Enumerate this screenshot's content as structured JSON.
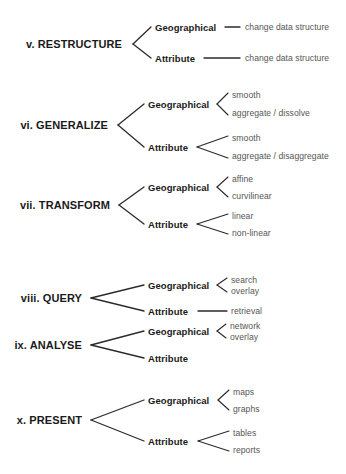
{
  "diagram": {
    "background_color": "#ffffff",
    "label_color": "#1a1a1a",
    "leaf_color": "#565656",
    "line_color": "#2b2b2b",
    "sections": [
      {
        "id": "restructure",
        "label": "v. RESTRUCTURE",
        "label_x": 122,
        "label_y": 44,
        "label_align": "right",
        "fork_x": 133,
        "fork_end_x": 151,
        "branches": [
          {
            "id": "restructure-geographical",
            "label": "Geographical",
            "label_x": 155,
            "label_y": 27,
            "connector": {
              "type": "line",
              "x1": 225,
              "x2": 240
            },
            "leaves": [
              {
                "id": "restructure-geographical-leaf-1",
                "label": "change data structure",
                "x": 245,
                "y": 27
              }
            ]
          },
          {
            "id": "restructure-attribute",
            "label": "Attribute",
            "label_x": 155,
            "label_y": 58,
            "connector": {
              "type": "line",
              "x1": 204,
              "x2": 240
            },
            "leaves": [
              {
                "id": "restructure-attribute-leaf-1",
                "label": "change data structure",
                "x": 245,
                "y": 58
              }
            ]
          }
        ]
      },
      {
        "id": "generalize",
        "label": "vi. GENERALIZE",
        "label_x": 108,
        "label_y": 125,
        "label_align": "right",
        "fork_x": 118,
        "fork_end_x": 144,
        "branches": [
          {
            "id": "generalize-geographical",
            "label": "Geographical",
            "label_x": 148,
            "label_y": 104,
            "connector": {
              "type": "fork",
              "x": 217,
              "end_x": 228,
              "spread": 11
            },
            "leaves": [
              {
                "id": "generalize-geographical-leaf-1",
                "label": "smooth",
                "x": 232,
                "y": 95
              },
              {
                "id": "generalize-geographical-leaf-2",
                "label": "aggregate / dissolve",
                "x": 232,
                "y": 113
              }
            ]
          },
          {
            "id": "generalize-attribute",
            "label": "Attribute",
            "label_x": 148,
            "label_y": 147,
            "connector": {
              "type": "fork",
              "x": 197,
              "end_x": 228,
              "spread": 11
            },
            "leaves": [
              {
                "id": "generalize-attribute-leaf-1",
                "label": "smooth",
                "x": 232,
                "y": 138
              },
              {
                "id": "generalize-attribute-leaf-2",
                "label": "aggregate / disaggregate",
                "x": 232,
                "y": 156
              }
            ]
          }
        ]
      },
      {
        "id": "transform",
        "label": "vii. TRANSFORM",
        "label_x": 110,
        "label_y": 205,
        "label_align": "right",
        "fork_x": 119,
        "fork_end_x": 144,
        "branches": [
          {
            "id": "transform-geographical",
            "label": "Geographical",
            "label_x": 148,
            "label_y": 187,
            "connector": {
              "type": "fork",
              "x": 217,
              "end_x": 228,
              "spread": 10
            },
            "leaves": [
              {
                "id": "transform-geographical-leaf-1",
                "label": "affine",
                "x": 232,
                "y": 179
              },
              {
                "id": "transform-geographical-leaf-2",
                "label": "curvilinear",
                "x": 232,
                "y": 196
              }
            ]
          },
          {
            "id": "transform-attribute",
            "label": "Attribute",
            "label_x": 148,
            "label_y": 224,
            "connector": {
              "type": "fork",
              "x": 197,
              "end_x": 228,
              "spread": 10
            },
            "leaves": [
              {
                "id": "transform-attribute-leaf-1",
                "label": "linear",
                "x": 232,
                "y": 216
              },
              {
                "id": "transform-attribute-leaf-2",
                "label": "non-linear",
                "x": 232,
                "y": 233
              }
            ]
          }
        ]
      },
      {
        "id": "query",
        "label": "viii. QUERY",
        "label_x": 82,
        "label_y": 298,
        "label_align": "right",
        "fork_x": 91,
        "fork_end_x": 144,
        "branches": [
          {
            "id": "query-geographical",
            "label": "Geographical",
            "label_x": 148,
            "label_y": 285,
            "connector": {
              "type": "fork",
              "x": 217,
              "end_x": 227,
              "spread": 7
            },
            "leaves": [
              {
                "id": "query-geographical-leaf-1",
                "label": "search",
                "x": 231,
                "y": 280
              },
              {
                "id": "query-geographical-leaf-2",
                "label": "overlay",
                "x": 231,
                "y": 291
              }
            ]
          },
          {
            "id": "query-attribute",
            "label": "Attribute",
            "label_x": 148,
            "label_y": 311,
            "connector": {
              "type": "line",
              "x1": 198,
              "x2": 227
            },
            "leaves": [
              {
                "id": "query-attribute-leaf-1",
                "label": "retrieval",
                "x": 231,
                "y": 311
              }
            ]
          }
        ]
      },
      {
        "id": "analyse",
        "label": "ix. ANALYSE",
        "label_x": 82,
        "label_y": 345,
        "label_align": "right",
        "fork_x": 91,
        "fork_end_x": 144,
        "branches": [
          {
            "id": "analyse-geographical",
            "label": "Geographical",
            "label_x": 148,
            "label_y": 331,
            "connector": {
              "type": "fork",
              "x": 217,
              "end_x": 226,
              "spread": 7
            },
            "leaves": [
              {
                "id": "analyse-geographical-leaf-1",
                "label": "network",
                "x": 230,
                "y": 326
              },
              {
                "id": "analyse-geographical-leaf-2",
                "label": "overlay",
                "x": 230,
                "y": 337
              }
            ]
          },
          {
            "id": "analyse-attribute",
            "label": "Attribute",
            "label_x": 148,
            "label_y": 358,
            "connector": {
              "type": "none"
            },
            "leaves": []
          }
        ]
      },
      {
        "id": "present",
        "label": "x. PRESENT",
        "label_x": 82,
        "label_y": 420,
        "label_align": "right",
        "fork_x": 91,
        "fork_end_x": 144,
        "branches": [
          {
            "id": "present-geographical",
            "label": "Geographical",
            "label_x": 148,
            "label_y": 400,
            "connector": {
              "type": "fork",
              "x": 218,
              "end_x": 229,
              "spread": 10
            },
            "leaves": [
              {
                "id": "present-geographical-leaf-1",
                "label": "maps",
                "x": 233,
                "y": 392
              },
              {
                "id": "present-geographical-leaf-2",
                "label": "graphs",
                "x": 233,
                "y": 409
              }
            ]
          },
          {
            "id": "present-attribute",
            "label": "Attribute",
            "label_x": 148,
            "label_y": 441,
            "connector": {
              "type": "fork",
              "x": 198,
              "end_x": 229,
              "spread": 10
            },
            "leaves": [
              {
                "id": "present-attribute-leaf-1",
                "label": "tables",
                "x": 233,
                "y": 433
              },
              {
                "id": "present-attribute-leaf-2",
                "label": "reports",
                "x": 233,
                "y": 450
              }
            ]
          }
        ]
      }
    ]
  }
}
